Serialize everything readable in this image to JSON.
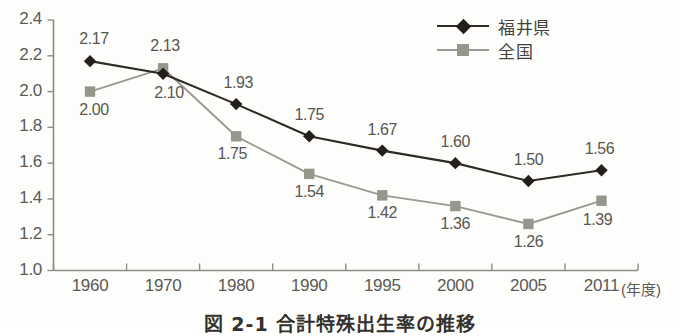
{
  "chart_data": {
    "type": "line",
    "title": "図 2-1 合計特殊出生率の推移",
    "xlabel": "(年度)",
    "ylabel": "",
    "categories": [
      "1960",
      "1970",
      "1980",
      "1990",
      "1995",
      "2000",
      "2005",
      "2011"
    ],
    "ylim": [
      1.0,
      2.4
    ],
    "ytick_step": 0.2,
    "yticks": [
      "2.4",
      "2.2",
      "2.0",
      "1.8",
      "1.6",
      "1.4",
      "1.2",
      "1.0"
    ],
    "grid": false,
    "legend_position": "top-right",
    "series": [
      {
        "name": "福井県",
        "color": "#2e2b26",
        "marker": "diamond",
        "label_position": "above",
        "values": [
          2.17,
          2.1,
          1.93,
          1.75,
          1.67,
          1.6,
          1.5,
          1.56
        ],
        "labels": [
          "2.17",
          "2.10",
          "1.93",
          "1.75",
          "1.67",
          "1.60",
          "1.50",
          "1.56"
        ]
      },
      {
        "name": "全国",
        "color": "#9b9a90",
        "marker": "square",
        "label_position": "below",
        "values": [
          2.0,
          2.13,
          1.75,
          1.54,
          1.42,
          1.36,
          1.26,
          1.39
        ],
        "labels": [
          "2.00",
          "2.13",
          "1.75",
          "1.54",
          "1.42",
          "1.36",
          "1.26",
          "1.39"
        ]
      }
    ]
  },
  "axis": {
    "x_unit_label": "(年度)"
  },
  "legend": {
    "items": [
      {
        "label": "福井県"
      },
      {
        "label": "全国"
      }
    ]
  },
  "caption": {
    "text": "図 2-1  合計特殊出生率の推移"
  }
}
